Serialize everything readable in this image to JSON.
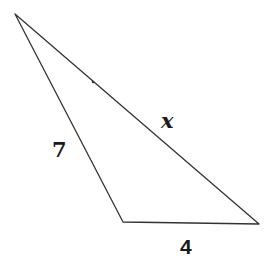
{
  "diagram": {
    "type": "triangle",
    "vertices": [
      {
        "name": "top",
        "x": 15,
        "y": 14
      },
      {
        "name": "bottom-left",
        "x": 123,
        "y": 222
      },
      {
        "name": "bottom-right",
        "x": 259,
        "y": 224
      }
    ],
    "sides": [
      {
        "name": "left-side",
        "label": "7"
      },
      {
        "name": "hypotenuse",
        "label": "x"
      },
      {
        "name": "bottom-side",
        "label": "4"
      }
    ],
    "line_color": "#333333",
    "label_color": "#1a1a1a"
  }
}
